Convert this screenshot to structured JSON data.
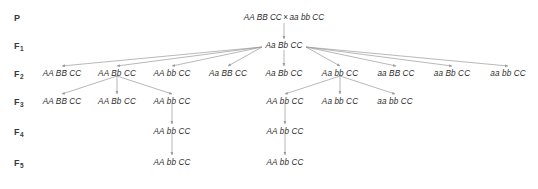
{
  "diagram": {
    "text_color": "#2e2e2e",
    "arrow_color": "#9a9a9a",
    "background": "#ffffff"
  },
  "generations": [
    {
      "key": "P",
      "label": "P",
      "sub": ""
    },
    {
      "key": "F1",
      "label": "F",
      "sub": "1"
    },
    {
      "key": "F2",
      "label": "F",
      "sub": "2"
    },
    {
      "key": "F3",
      "label": "F",
      "sub": "3"
    },
    {
      "key": "F4",
      "label": "F",
      "sub": "4"
    },
    {
      "key": "F5",
      "label": "F",
      "sub": "5"
    }
  ],
  "p_cross": {
    "parent1": "AA BB CC",
    "symbol": "×",
    "parent2": "aa bb CC"
  },
  "f1": {
    "genotype": "Aa Bb CC"
  },
  "f2": {
    "genotypes": [
      "AA BB CC",
      "AA Bb CC",
      "AA bb CC",
      "Aa BB CC",
      "Aa Bb CC",
      "Aa bb CC",
      "aa BB CC",
      "aa Bb CC",
      "aa bb CC"
    ]
  },
  "f3": {
    "left_group": [
      "AA BB CC",
      "AA Bb CC",
      "AA bb CC"
    ],
    "right_group": [
      "AA bb CC",
      "Aa bb CC",
      "aa bb CC"
    ]
  },
  "f4": {
    "genotypes": [
      "AA bb CC",
      "AA bb CC"
    ]
  },
  "f5": {
    "genotypes": [
      "AA bb CC",
      "AA bb CC"
    ]
  }
}
